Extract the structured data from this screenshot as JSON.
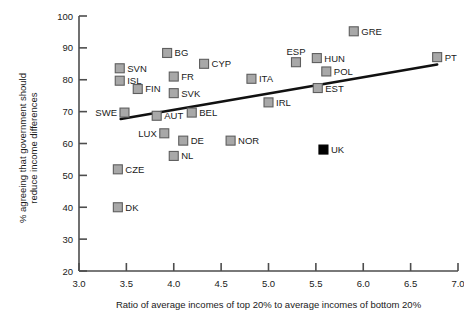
{
  "chart_data": {
    "type": "scatter",
    "title": "",
    "xlabel": "Ratio of average incomes of top 20% to average incomes of bottom 20%",
    "ylabel": "% agreeing that government should reduce income differences",
    "xlim": [
      3.0,
      7.0
    ],
    "ylim": [
      20,
      100
    ],
    "xticks": [
      "3.0",
      "3.5",
      "4.0",
      "4.5",
      "5.0",
      "5.5",
      "6.0",
      "6.5",
      "7.0"
    ],
    "xtick_values": [
      3.0,
      3.5,
      4.0,
      4.5,
      5.0,
      5.5,
      6.0,
      6.5,
      7.0
    ],
    "yticks": [
      "20",
      "30",
      "40",
      "50",
      "60",
      "70",
      "80",
      "90",
      "100"
    ],
    "ytick_values": [
      20,
      30,
      40,
      50,
      60,
      70,
      80,
      90,
      100
    ],
    "grid": false,
    "legend": false,
    "trendline": {
      "x_start": 3.44,
      "y_start": 67.7,
      "x_end": 6.78,
      "y_end": 84.8,
      "color": "#111111"
    },
    "marker_colors": {
      "open": "#a8a8a8",
      "filled": "#000000"
    },
    "points": [
      {
        "label": "BG",
        "x": 3.93,
        "y": 88.4,
        "style": "open",
        "label_side": "right"
      },
      {
        "label": "CYP",
        "x": 4.32,
        "y": 85.0,
        "style": "open",
        "label_side": "right"
      },
      {
        "label": "GRE",
        "x": 5.9,
        "y": 95.2,
        "style": "open",
        "label_side": "right"
      },
      {
        "label": "SVN",
        "x": 3.43,
        "y": 83.6,
        "style": "open",
        "label_side": "right"
      },
      {
        "label": "ISL",
        "x": 3.43,
        "y": 79.7,
        "style": "open",
        "label_side": "right"
      },
      {
        "label": "FIN",
        "x": 3.62,
        "y": 77.1,
        "style": "open",
        "label_side": "right"
      },
      {
        "label": "FR",
        "x": 4.0,
        "y": 81.0,
        "style": "open",
        "label_side": "right"
      },
      {
        "label": "SVK",
        "x": 4.0,
        "y": 75.8,
        "style": "open",
        "label_side": "right"
      },
      {
        "label": "ITA",
        "x": 4.82,
        "y": 80.3,
        "style": "open",
        "label_side": "right"
      },
      {
        "label": "ESP",
        "x": 5.29,
        "y": 85.5,
        "style": "open",
        "label_side": "above"
      },
      {
        "label": "HUN",
        "x": 5.51,
        "y": 86.8,
        "style": "open",
        "label_side": "right"
      },
      {
        "label": "POL",
        "x": 5.61,
        "y": 82.6,
        "style": "open",
        "label_side": "right"
      },
      {
        "label": "EST",
        "x": 5.52,
        "y": 77.4,
        "style": "open",
        "label_side": "right"
      },
      {
        "label": "IRL",
        "x": 5.0,
        "y": 72.9,
        "style": "open",
        "label_side": "right"
      },
      {
        "label": "PT",
        "x": 6.78,
        "y": 87.1,
        "style": "open",
        "label_side": "right"
      },
      {
        "label": "SWE",
        "x": 3.48,
        "y": 69.7,
        "style": "open",
        "label_side": "left"
      },
      {
        "label": "AUT",
        "x": 3.82,
        "y": 68.7,
        "style": "open",
        "label_side": "right"
      },
      {
        "label": "BEL",
        "x": 4.19,
        "y": 69.7,
        "style": "open",
        "label_side": "right"
      },
      {
        "label": "LUX",
        "x": 3.9,
        "y": 63.2,
        "style": "open",
        "label_side": "left"
      },
      {
        "label": "DE",
        "x": 4.1,
        "y": 60.9,
        "style": "open",
        "label_side": "right"
      },
      {
        "label": "NOR",
        "x": 4.6,
        "y": 60.9,
        "style": "open",
        "label_side": "right"
      },
      {
        "label": "NL",
        "x": 4.0,
        "y": 56.1,
        "style": "open",
        "label_side": "right"
      },
      {
        "label": "CZE",
        "x": 3.41,
        "y": 51.9,
        "style": "open",
        "label_side": "right"
      },
      {
        "label": "DK",
        "x": 3.41,
        "y": 40.0,
        "style": "open",
        "label_side": "right"
      },
      {
        "label": "UK",
        "x": 5.58,
        "y": 58.1,
        "style": "filled",
        "label_side": "right"
      }
    ]
  }
}
